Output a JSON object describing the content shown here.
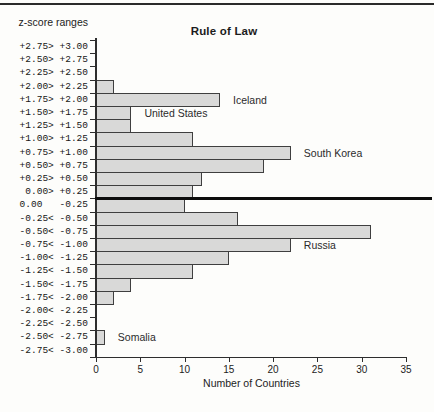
{
  "figure": {
    "title": "Rule of Law",
    "y_axis_header": "z-score ranges",
    "x_axis_label": "Number of Countries"
  },
  "colors": {
    "background": "#fdfdfb",
    "bar_fill": "#d9d9d8",
    "bar_border": "#3f3f3f",
    "axis": "#2e2e2e",
    "zero_divider": "#0d0d0d",
    "top_rule": "#2a2a2a",
    "text": "#1c1c1c"
  },
  "chart_data": {
    "type": "bar",
    "orientation": "horizontal",
    "title": "Rule of Law",
    "xlabel": "Number of Countries",
    "ylabel": "z-score ranges",
    "xlim": [
      0,
      35
    ],
    "x_ticks": [
      0,
      5,
      10,
      15,
      20,
      25,
      30,
      35
    ],
    "grid": false,
    "zero_divider_after_index": 11,
    "rows": [
      {
        "range": "+2.75> +3.00",
        "value": 0
      },
      {
        "range": "+2.50> +2.75",
        "value": 0
      },
      {
        "range": "+2.25> +2.50",
        "value": 0
      },
      {
        "range": "+2.00> +2.25",
        "value": 2
      },
      {
        "range": "+1.75> +2.00",
        "value": 14,
        "country": "Iceland"
      },
      {
        "range": "+1.50> +1.75",
        "value": 4,
        "country": "United States"
      },
      {
        "range": "+1.25> +1.50",
        "value": 4
      },
      {
        "range": "+1.00> +1.25",
        "value": 11
      },
      {
        "range": "+0.75> +1.00",
        "value": 22,
        "country": "South Korea"
      },
      {
        "range": "+0.50> +0.75",
        "value": 19
      },
      {
        "range": "+0.25> +0.50",
        "value": 12
      },
      {
        "range": "0.00> +0.25",
        "value": 11
      },
      {
        "range": "0.00   -0.25",
        "value": 10
      },
      {
        "range": "-0.25< -0.50",
        "value": 16
      },
      {
        "range": "-0.50< -0.75",
        "value": 31
      },
      {
        "range": "-0.75< -1.00",
        "value": 22,
        "country": "Russia"
      },
      {
        "range": "-1.00< -1.25",
        "value": 15
      },
      {
        "range": "-1.25< -1.50",
        "value": 11
      },
      {
        "range": "-1.50< -1.75",
        "value": 4
      },
      {
        "range": "-1.75< -2.00",
        "value": 2
      },
      {
        "range": "-2.00< -2.25",
        "value": 0
      },
      {
        "range": "-2.25< -2.50",
        "value": 0
      },
      {
        "range": "-2.50< -2.75",
        "value": 1,
        "country": "Somalia"
      },
      {
        "range": "-2.75< -3.00",
        "value": 0
      }
    ]
  }
}
